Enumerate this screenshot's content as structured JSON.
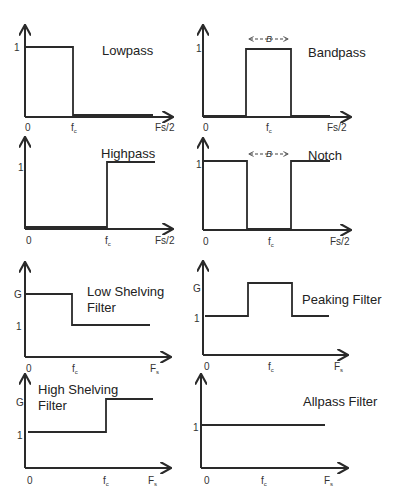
{
  "figure": {
    "panels": [
      {
        "id": "lowpass",
        "title": "Lowpass",
        "y_ticks": [
          "1"
        ],
        "x_ticks": [
          "0",
          "fc",
          "Fs/2"
        ],
        "response": "pass below fc, 0 above"
      },
      {
        "id": "bandpass",
        "title": "Bandpass",
        "y_ticks": [
          "1"
        ],
        "x_ticks": [
          "0",
          "fc",
          "Fs/2"
        ],
        "bandwidth_label": "B",
        "response": "1 within band B around fc"
      },
      {
        "id": "highpass",
        "title": "Highpass",
        "y_ticks": [
          "1"
        ],
        "x_ticks": [
          "0",
          "fc",
          "Fs/2"
        ],
        "response": "0 below fc, 1 above"
      },
      {
        "id": "notch",
        "title": "Notch",
        "y_ticks": [
          "1"
        ],
        "x_ticks": [
          "0",
          "fc",
          "Fs/2"
        ],
        "bandwidth_label": "B",
        "response": "0 within band B around fc"
      },
      {
        "id": "low-shelving",
        "title_line1": "Low Shelving",
        "title_line2": "Filter",
        "y_ticks": [
          "G",
          "1"
        ],
        "x_ticks": [
          "0",
          "fc",
          "Fs"
        ],
        "response": "G below fc, 1 above"
      },
      {
        "id": "peaking",
        "title": "Peaking Filter",
        "y_ticks": [
          "G",
          "1"
        ],
        "x_ticks": [
          "0",
          "fc",
          "Fs"
        ],
        "response": "G around fc, 1 elsewhere"
      },
      {
        "id": "high-shelving",
        "title_line1": "High Shelving",
        "title_line2": "Filter",
        "y_ticks": [
          "G",
          "1"
        ],
        "x_ticks": [
          "0",
          "fc",
          "Fs"
        ],
        "response": "1 below fc, G above"
      },
      {
        "id": "allpass",
        "title": "Allpass Filter",
        "y_ticks": [
          "1"
        ],
        "x_ticks": [
          "0",
          "fc",
          "Fs"
        ],
        "response": "1 at all frequencies"
      }
    ]
  }
}
